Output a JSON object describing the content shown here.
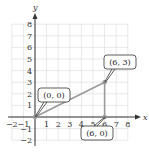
{
  "chart_data": {
    "type": "line",
    "title": "",
    "xlabel": "x",
    "ylabel": "y",
    "xlim": [
      -2,
      8
    ],
    "ylim": [
      -2,
      8
    ],
    "grid": true,
    "x_ticks": [
      "−2",
      "−1",
      "1",
      "2",
      "3",
      "4",
      "5",
      "6",
      "7",
      "8"
    ],
    "y_ticks": [
      "8",
      "7",
      "6",
      "5",
      "4",
      "3",
      "2",
      "1",
      "−1",
      "−2"
    ],
    "points": [
      {
        "x": 0,
        "y": 0,
        "label": "(0, 0)"
      },
      {
        "x": 6,
        "y": 3,
        "label": "(6, 3)"
      },
      {
        "x": 6,
        "y": 0,
        "label": "(6, 0)"
      }
    ],
    "segments": [
      {
        "from": [
          0,
          0
        ],
        "to": [
          6,
          3
        ]
      },
      {
        "from": [
          6,
          0
        ],
        "to": [
          6,
          3
        ]
      }
    ],
    "colors": {
      "segment": "#9a9a9a",
      "grid": "#d8d8d8",
      "axis": "#333333"
    }
  }
}
